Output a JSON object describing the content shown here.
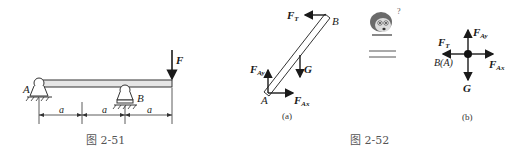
{
  "figure_2_51": {
    "caption": "图 2-51",
    "labels": {
      "support_a": "A",
      "support_b": "B",
      "force": "F",
      "span": "a"
    },
    "spans": [
      "a",
      "a",
      "a"
    ]
  },
  "figure_2_52": {
    "caption": "图 2-52",
    "sub_a": {
      "caption": "(a)",
      "labels": {
        "point_a": "A",
        "point_b": "B",
        "tension": "F",
        "tension_sub": "T",
        "gravity": "G",
        "fay": "F",
        "fay_sub": "Ay",
        "fax": "F",
        "fax_sub": "Ax"
      }
    },
    "sub_b": {
      "caption": "(b)",
      "labels": {
        "point": "B(A)",
        "tension": "F",
        "tension_sub": "T",
        "gravity": "G",
        "fay": "F",
        "fay_sub": "Ay",
        "fax": "F",
        "fax_sub": "Ax"
      }
    },
    "question_mark": "?"
  }
}
